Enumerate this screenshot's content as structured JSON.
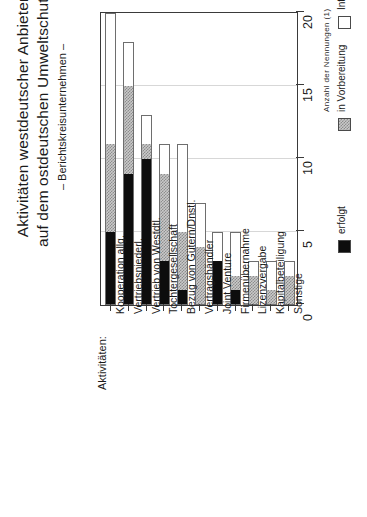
{
  "title": {
    "line1": "Aktivitäten westdeutscher Anbieter",
    "line2": "auf dem ostdeutschen Umweltschutzmarkt",
    "subtitle": "– Berichtskreisunternehmen –"
  },
  "category_axis_title": "Aktivitäten:",
  "value_axis_title": "Anzahl der Nennungen (1)",
  "legend": {
    "position": "right",
    "items": [
      {
        "label": "erfolgt",
        "swatch": "black-solid-swatch",
        "color": "#0d0d0d"
      },
      {
        "label": "in Vorbereitung",
        "swatch": "gray-hatched-swatch",
        "color": "#a8a8a8"
      },
      {
        "label": "Interesse",
        "swatch": "white-empty-swatch",
        "color": "#ffffff"
      }
    ]
  },
  "chart_data": {
    "type": "bar",
    "title": "Aktivitäten westdeutscher Anbieter auf dem ostdeutschen Umweltschutzmarkt",
    "subtitle": "– Berichtskreisunternehmen –",
    "orientation": "vertical-stacked",
    "xlabel": "Aktivitäten:",
    "ylabel": "Anzahl der Nennungen (1)",
    "ylim": [
      0,
      20
    ],
    "yticks": [
      0,
      5,
      10,
      15,
      20
    ],
    "grid": true,
    "categories": [
      "Kooperation allg.",
      "Vertriebsniederl.",
      "Vertrieb von Westdtl.",
      "Tochtergesellschaft",
      "Bezug von Gütern/Dnstl.",
      "Vertragshändler",
      "Joint Venture",
      "Firmenübernahme",
      "Lizenzvergabe",
      "Kapitalbeteiligung",
      "Sonstige"
    ],
    "series": [
      {
        "name": "erfolgt",
        "values": [
          5,
          9,
          10,
          3,
          1,
          0,
          3,
          1,
          0,
          0,
          0
        ]
      },
      {
        "name": "in Vorbereitung",
        "values": [
          6,
          6,
          1,
          6,
          4,
          4,
          0,
          1,
          2,
          1,
          2
        ]
      },
      {
        "name": "Interesse",
        "values": [
          9,
          3,
          2,
          2,
          6,
          3,
          2,
          3,
          1,
          2,
          1
        ]
      }
    ],
    "totals": [
      20,
      18,
      13,
      11,
      11,
      7,
      5,
      5,
      3,
      3,
      3
    ]
  }
}
